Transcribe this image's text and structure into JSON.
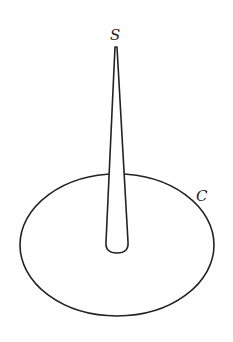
{
  "diagram": {
    "labels": {
      "tip": "S",
      "curve": "C"
    },
    "colors": {
      "stroke": "#222222",
      "background": "#ffffff"
    }
  }
}
